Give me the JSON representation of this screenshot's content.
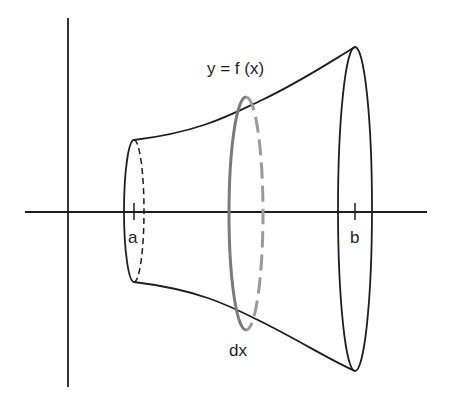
{
  "diagram": {
    "labels": {
      "function": "y = f (x)",
      "left_bound": "a",
      "right_bound": "b",
      "slice_width": "dx"
    },
    "colors": {
      "stroke": "#1e1e1e",
      "slice": "#7a7a7a",
      "background": "#ffffff"
    },
    "axes": {
      "x_axis": {
        "y": 212,
        "x_start": 25,
        "x_end": 427
      },
      "y_axis": {
        "x": 68,
        "y_start": 18,
        "y_end": 387
      }
    },
    "cross_sections": [
      {
        "name": "left-end",
        "cx": 134,
        "top": 140,
        "bottom": 282,
        "rx": 10
      },
      {
        "name": "slice",
        "cx": 246,
        "top": 97,
        "bottom": 330,
        "rx": 17
      },
      {
        "name": "right-end",
        "cx": 355,
        "top": 47,
        "bottom": 371,
        "rx": 17
      }
    ]
  }
}
